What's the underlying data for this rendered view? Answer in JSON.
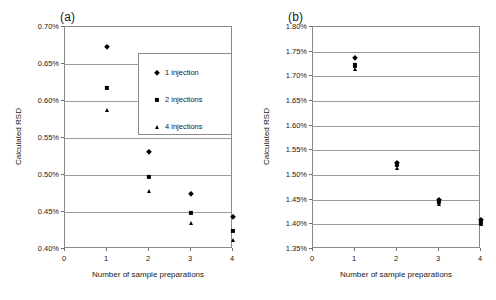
{
  "figure": {
    "panels": [
      {
        "tag": "(a)",
        "xlabel": "Number of sample preparations",
        "ylabel": "Calculated RSD",
        "xticks": [
          "0",
          "1",
          "2",
          "3",
          "4"
        ],
        "yticks": [
          "0.40%",
          "0.45%",
          "0.50%",
          "0.55%",
          "0.60%",
          "0.65%",
          "0.70%"
        ],
        "legend": [
          {
            "label": "1 injection",
            "marker": "diamond"
          },
          {
            "label": "2 injections",
            "marker": "square"
          },
          {
            "label": "4 injections",
            "marker": "triangle"
          }
        ]
      },
      {
        "tag": "(b)",
        "xlabel": "Number of sample preparations",
        "ylabel": "Calculated RSD",
        "xticks": [
          "0",
          "1",
          "2",
          "3",
          "4"
        ],
        "yticks": [
          "1.35%",
          "1.40%",
          "1.45%",
          "1.50%",
          "1.55%",
          "1.60%",
          "1.65%",
          "1.70%",
          "1.75%",
          "1.80%"
        ]
      }
    ]
  },
  "chart_data": [
    {
      "type": "scatter",
      "panel": "(a)",
      "title": "",
      "xlabel": "Number of sample preparations",
      "ylabel": "Calculated RSD",
      "xlim": [
        0,
        4
      ],
      "ylim": [
        0.4,
        0.7
      ],
      "yunit": "%",
      "ytick_step": 0.05,
      "grid": true,
      "legend_position": "inside-upper-right",
      "x": [
        1,
        2,
        3,
        4
      ],
      "series": [
        {
          "name": "1 injection",
          "marker": "diamond",
          "values": [
            0.673,
            0.531,
            0.474,
            0.443
          ]
        },
        {
          "name": "2 injections",
          "marker": "square",
          "values": [
            0.618,
            0.497,
            0.449,
            0.424
          ]
        },
        {
          "name": "4 injections",
          "marker": "triangle",
          "values": [
            0.588,
            0.478,
            0.435,
            0.412
          ]
        }
      ]
    },
    {
      "type": "scatter",
      "panel": "(b)",
      "title": "",
      "xlabel": "Number of sample preparations",
      "ylabel": "Calculated RSD",
      "xlim": [
        0,
        4
      ],
      "ylim": [
        1.35,
        1.8
      ],
      "yunit": "%",
      "ytick_step": 0.05,
      "grid": true,
      "legend_position": "none",
      "x": [
        1,
        2,
        3,
        4
      ],
      "series": [
        {
          "name": "1 injection",
          "marker": "diamond",
          "values": [
            1.737,
            1.524,
            1.449,
            1.408
          ]
        },
        {
          "name": "2 injections",
          "marker": "square",
          "values": [
            1.722,
            1.52,
            1.446,
            1.404
          ]
        },
        {
          "name": "4 injections",
          "marker": "triangle",
          "values": [
            1.714,
            1.515,
            1.442,
            1.4
          ]
        }
      ]
    }
  ]
}
